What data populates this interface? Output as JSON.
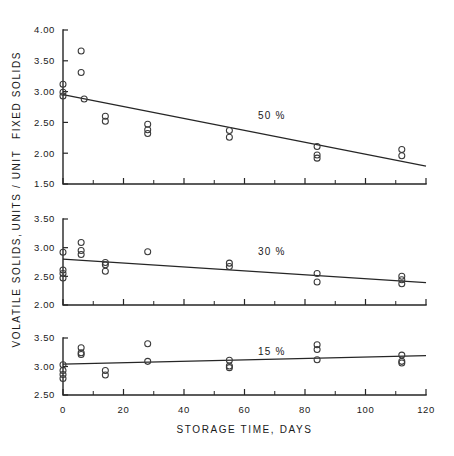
{
  "figure": {
    "background": "#ffffff",
    "ink_color": "#262626",
    "marker_style": "open-circle"
  },
  "axes": {
    "x": {
      "title": "STORAGE  TIME,    DAYS",
      "min": 0,
      "max": 120,
      "major_step": 20,
      "minor_step": 10,
      "tick_labels": [
        "0",
        "20",
        "40",
        "60",
        "80",
        "100",
        "120"
      ],
      "tick_values": [
        0,
        20,
        40,
        60,
        80,
        100,
        120
      ]
    },
    "y": {
      "title_lines": [
        "VOLATILE  SOLIDS,",
        "UNITS / UNIT",
        "FIXED  SOLIDS"
      ],
      "title_full": "VOLATILE SOLIDS, UNITS / UNIT FIXED SOLIDS",
      "orientation": "vertical-bottom-to-top"
    }
  },
  "chart_data": {
    "type": "scatter",
    "title": "",
    "xlabel": "STORAGE  TIME,    DAYS",
    "ylabel": "VOLATILE SOLIDS, UNITS / UNIT FIXED SOLIDS",
    "grid": false,
    "legend": "none",
    "panels": [
      {
        "id": "panel-50",
        "annotation": "50 %",
        "annotation_x": 69,
        "annotation_y": 2.55,
        "ylim": [
          1.5,
          4.0
        ],
        "ytick_step": 0.5,
        "ytick_labels": [
          "1.50",
          "2.00",
          "2.50",
          "3.00",
          "3.50",
          "4.00"
        ],
        "ytick_values": [
          1.5,
          2.0,
          2.5,
          3.0,
          3.5,
          4.0
        ],
        "xlim": [
          0,
          120
        ],
        "trendline": {
          "x0": 0,
          "y0": 2.95,
          "x1": 120,
          "y1": 1.79
        },
        "points": [
          {
            "x": 0,
            "y": 3.12
          },
          {
            "x": 0,
            "y": 2.99
          },
          {
            "x": 0,
            "y": 2.93
          },
          {
            "x": 6,
            "y": 3.66
          },
          {
            "x": 6,
            "y": 3.31
          },
          {
            "x": 7,
            "y": 2.88
          },
          {
            "x": 14,
            "y": 2.6
          },
          {
            "x": 14,
            "y": 2.52
          },
          {
            "x": 28,
            "y": 2.47
          },
          {
            "x": 28,
            "y": 2.38
          },
          {
            "x": 28,
            "y": 2.32
          },
          {
            "x": 55,
            "y": 2.37
          },
          {
            "x": 55,
            "y": 2.26
          },
          {
            "x": 84,
            "y": 2.11
          },
          {
            "x": 84,
            "y": 1.97
          },
          {
            "x": 84,
            "y": 1.92
          },
          {
            "x": 112,
            "y": 2.06
          },
          {
            "x": 112,
            "y": 1.96
          }
        ]
      },
      {
        "id": "panel-30",
        "annotation": "30 %",
        "annotation_x": 69,
        "annotation_y": 2.87,
        "ylim": [
          2.0,
          3.5
        ],
        "ytick_step": 0.5,
        "ytick_labels": [
          "2.00",
          "2.50",
          "3.00",
          "3.50"
        ],
        "ytick_values": [
          2.0,
          2.5,
          3.0,
          3.5
        ],
        "xlim": [
          0,
          120
        ],
        "trendline": {
          "x0": 0,
          "y0": 2.8,
          "x1": 120,
          "y1": 2.39
        },
        "points": [
          {
            "x": 0,
            "y": 2.92
          },
          {
            "x": 0,
            "y": 2.61
          },
          {
            "x": 0,
            "y": 2.55
          },
          {
            "x": 0,
            "y": 2.47
          },
          {
            "x": 6,
            "y": 3.09
          },
          {
            "x": 6,
            "y": 2.95
          },
          {
            "x": 6,
            "y": 2.88
          },
          {
            "x": 14,
            "y": 2.74
          },
          {
            "x": 14,
            "y": 2.7
          },
          {
            "x": 14,
            "y": 2.59
          },
          {
            "x": 28,
            "y": 2.93
          },
          {
            "x": 55,
            "y": 2.73
          },
          {
            "x": 55,
            "y": 2.67
          },
          {
            "x": 84,
            "y": 2.55
          },
          {
            "x": 84,
            "y": 2.4
          },
          {
            "x": 112,
            "y": 2.5
          },
          {
            "x": 112,
            "y": 2.44
          },
          {
            "x": 112,
            "y": 2.37
          }
        ]
      },
      {
        "id": "panel-15",
        "annotation": "15 %",
        "annotation_x": 69,
        "annotation_y": 3.2,
        "ylim": [
          2.5,
          3.5
        ],
        "ytick_step": 0.5,
        "ytick_labels": [
          "2.50",
          "3.00",
          "3.50"
        ],
        "ytick_values": [
          2.5,
          3.0,
          3.5
        ],
        "xlim": [
          0,
          120
        ],
        "trendline": {
          "x0": 0,
          "y0": 3.04,
          "x1": 120,
          "y1": 3.19
        },
        "points": [
          {
            "x": 0,
            "y": 3.03
          },
          {
            "x": 0,
            "y": 2.93
          },
          {
            "x": 0,
            "y": 2.86
          },
          {
            "x": 0,
            "y": 2.79
          },
          {
            "x": 6,
            "y": 3.33
          },
          {
            "x": 6,
            "y": 3.24
          },
          {
            "x": 6,
            "y": 3.21
          },
          {
            "x": 14,
            "y": 2.93
          },
          {
            "x": 14,
            "y": 2.85
          },
          {
            "x": 28,
            "y": 3.4
          },
          {
            "x": 28,
            "y": 3.09
          },
          {
            "x": 55,
            "y": 3.11
          },
          {
            "x": 55,
            "y": 3.01
          },
          {
            "x": 55,
            "y": 2.98
          },
          {
            "x": 84,
            "y": 3.38
          },
          {
            "x": 84,
            "y": 3.3
          },
          {
            "x": 84,
            "y": 3.12
          },
          {
            "x": 112,
            "y": 3.2
          },
          {
            "x": 112,
            "y": 3.09
          },
          {
            "x": 112,
            "y": 3.06
          }
        ]
      }
    ]
  }
}
